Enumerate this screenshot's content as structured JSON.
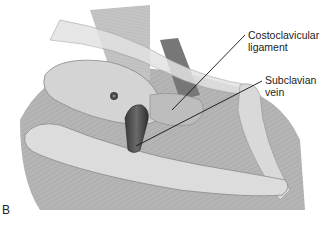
{
  "figure": {
    "panel_letter": "B",
    "labels": [
      {
        "id": "costoclavicular",
        "line1": "Costoclavicular",
        "line2": "ligament"
      },
      {
        "id": "subclavian",
        "line1": "Subclavian",
        "line2": "vein"
      }
    ]
  }
}
